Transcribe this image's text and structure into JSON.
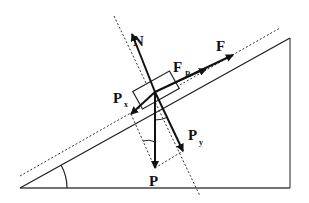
{
  "diagram": {
    "labels": {
      "normal": "N",
      "applied": "F",
      "friction_main": "F",
      "friction_sub": "R",
      "parallel_main": "P",
      "parallel_sub": "x",
      "perpendicular_main": "P",
      "perpendicular_sub": "y",
      "weight": "P"
    },
    "colors": {
      "line": "#111111",
      "incline": "#333333",
      "background": "#ffffff"
    }
  }
}
